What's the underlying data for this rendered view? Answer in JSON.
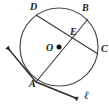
{
  "figure": {
    "kind": "circle-geometry-diagram",
    "width": 109,
    "height": 111,
    "background_color": "#ffffff",
    "stroke_color": "#2b2b2b",
    "label_color": "#1b1b1b"
  },
  "labels": {
    "point_D": "D",
    "point_B": "B",
    "point_E": "E",
    "center_O": "O",
    "point_C": "C",
    "point_A": "A",
    "line_l": "ℓ"
  },
  "geometry": {
    "circle": {
      "center_x": 59,
      "center_y": 47,
      "radius": 39
    },
    "center_dot": {
      "x": 59,
      "y": 47,
      "radius": 2.4
    },
    "points": {
      "D": {
        "x": 36,
        "y": 15
      },
      "B": {
        "x": 88,
        "y": 19
      },
      "E": {
        "x": 78,
        "y": 32
      },
      "O": {
        "x": 59,
        "y": 47
      },
      "C": {
        "x": 97,
        "y": 53
      },
      "A": {
        "x": 36,
        "y": 82
      }
    },
    "chords": [
      {
        "name": "chord-DC",
        "from": "D",
        "to": "C"
      },
      {
        "name": "chord-AB",
        "from": "A",
        "to": "B"
      }
    ],
    "diameter": {
      "name": "diameter-AB-through-O",
      "from": "A",
      "to": "B"
    },
    "line_l": {
      "name": "line-l",
      "through": "A",
      "arrow_start": {
        "x": 4,
        "y": 46
      },
      "arrow_end": {
        "x": 80,
        "y": 101
      }
    }
  }
}
